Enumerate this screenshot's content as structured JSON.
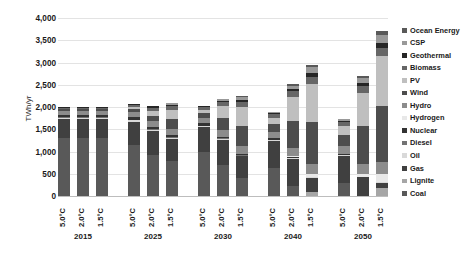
{
  "chart_data": {
    "type": "bar",
    "title": "",
    "subtitle": "",
    "xlabel": "",
    "ylabel": "TWh/yr",
    "ylim": [
      0,
      4000
    ],
    "ytick_labels": [
      "4,000",
      "3,500",
      "3,000",
      "2,500",
      "2,000",
      "1,500",
      "1,000",
      "500",
      "0"
    ],
    "ytick_values": [
      4000,
      3500,
      3000,
      2500,
      2000,
      1500,
      1000,
      500,
      0
    ],
    "grid": true,
    "stacked": true,
    "legend_position": "right",
    "group_labels": [
      "2015",
      "2025",
      "2030",
      "2040",
      "2050"
    ],
    "scenario_labels": [
      "5.0°C",
      "2.0°C",
      "1.5°C"
    ],
    "series": [
      {
        "name": "Coal",
        "color": "#595959",
        "values": [
          1300,
          1300,
          1300,
          1150,
          930,
          780,
          980,
          700,
          400,
          620,
          230,
          0,
          300,
          0,
          0
        ]
      },
      {
        "name": "Lignite",
        "color": "#a6a6a6",
        "values": [
          0,
          0,
          0,
          0,
          0,
          0,
          0,
          0,
          0,
          0,
          0,
          90,
          0,
          0,
          170
        ]
      },
      {
        "name": "Gas",
        "color": "#404040",
        "values": [
          420,
          420,
          420,
          520,
          530,
          500,
          560,
          560,
          490,
          620,
          610,
          320,
          600,
          420,
          130
        ]
      },
      {
        "name": "Oil",
        "color": "#d9d9d9",
        "values": [
          30,
          30,
          30,
          30,
          30,
          30,
          30,
          20,
          20,
          20,
          15,
          10,
          15,
          10,
          5
        ]
      },
      {
        "name": "Diesel",
        "color": "#737373",
        "values": [
          20,
          20,
          20,
          20,
          20,
          20,
          15,
          15,
          15,
          10,
          10,
          5,
          10,
          5,
          5
        ]
      },
      {
        "name": "Nuclear",
        "color": "#333333",
        "values": [
          60,
          60,
          60,
          60,
          50,
          50,
          50,
          40,
          30,
          30,
          20,
          0,
          20,
          0,
          0
        ]
      },
      {
        "name": "Hydrogen",
        "color": "#e8e8e8",
        "values": [
          0,
          0,
          0,
          0,
          0,
          0,
          0,
          0,
          0,
          0,
          10,
          60,
          10,
          70,
          180
        ]
      },
      {
        "name": "Hydro",
        "color": "#8c8c8c",
        "values": [
          90,
          90,
          90,
          110,
          120,
          130,
          120,
          140,
          160,
          140,
          180,
          230,
          160,
          210,
          280
        ]
      },
      {
        "name": "Wind",
        "color": "#4d4d4d",
        "values": [
          30,
          30,
          30,
          70,
          130,
          220,
          110,
          290,
          470,
          180,
          620,
          960,
          250,
          850,
          1250
        ]
      },
      {
        "name": "PV",
        "color": "#bfbfbf",
        "values": [
          10,
          10,
          10,
          40,
          110,
          200,
          70,
          250,
          420,
          140,
          540,
          840,
          200,
          760,
          1120
        ]
      },
      {
        "name": "Biomass",
        "color": "#666666",
        "values": [
          30,
          30,
          30,
          50,
          70,
          90,
          60,
          90,
          110,
          80,
          120,
          160,
          90,
          140,
          190
        ]
      },
      {
        "name": "Geothermal",
        "color": "#262626",
        "values": [
          10,
          10,
          10,
          15,
          25,
          35,
          20,
          40,
          55,
          30,
          60,
          90,
          40,
          80,
          120
        ]
      },
      {
        "name": "CSP",
        "color": "#999999",
        "values": [
          0,
          0,
          0,
          5,
          15,
          30,
          10,
          30,
          60,
          20,
          70,
          130,
          30,
          110,
          180
        ]
      },
      {
        "name": "Ocean Energy",
        "color": "#595959",
        "values": [
          0,
          0,
          0,
          0,
          5,
          10,
          5,
          15,
          25,
          10,
          35,
          60,
          15,
          50,
          90
        ]
      }
    ],
    "bars": [
      {
        "group": "2015",
        "scenario": "5.0°C",
        "total": 2000
      },
      {
        "group": "2015",
        "scenario": "2.0°C",
        "total": 2000
      },
      {
        "group": "2015",
        "scenario": "1.5°C",
        "total": 2000
      },
      {
        "group": "2025",
        "scenario": "5.0°C",
        "total": 2070
      },
      {
        "group": "2025",
        "scenario": "2.0°C",
        "total": 2110
      },
      {
        "group": "2025",
        "scenario": "1.5°C",
        "total": 2095
      },
      {
        "group": "2030",
        "scenario": "5.0°C",
        "total": 2030
      },
      {
        "group": "2030",
        "scenario": "2.0°C",
        "total": 2190
      },
      {
        "group": "2030",
        "scenario": "1.5°C",
        "total": 2255
      },
      {
        "group": "2040",
        "scenario": "5.0°C",
        "total": 1900
      },
      {
        "group": "2040",
        "scenario": "2.0°C",
        "total": 2520
      },
      {
        "group": "2040",
        "scenario": "1.5°C",
        "total": 2955
      },
      {
        "group": "2050",
        "scenario": "5.0°C",
        "total": 1740
      },
      {
        "group": "2050",
        "scenario": "2.0°C",
        "total": 2705
      },
      {
        "group": "2050",
        "scenario": "1.5°C",
        "total": 3720
      }
    ]
  }
}
